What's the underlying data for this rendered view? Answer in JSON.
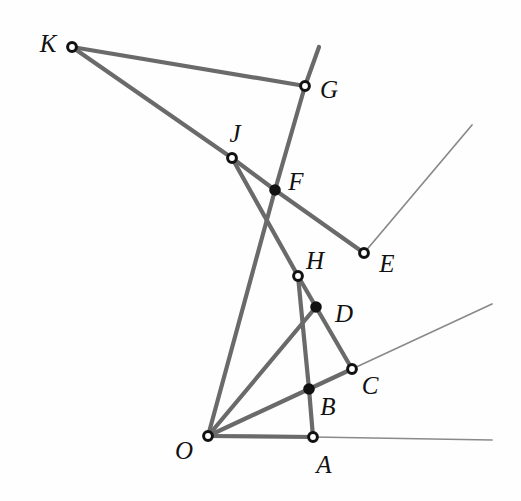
{
  "figure": {
    "kind": "geometry-diagram",
    "title": "",
    "background": "#fefefe",
    "stroke_thick": "#6a6a6a",
    "stroke_thin": "#8a8a8a",
    "dot_fill": "#111111",
    "dot_hollow_fill": "#ffffff",
    "dot_stroke": "#111111",
    "label_color": "#111111",
    "width": 521,
    "height": 501
  },
  "points": [
    {
      "id": "K",
      "label": "K",
      "x": 72,
      "y": 47,
      "marker": "hollow",
      "label_x": 48,
      "label_y": 43
    },
    {
      "id": "G",
      "label": "G",
      "x": 305,
      "y": 86,
      "marker": "hollow",
      "label_x": 329,
      "label_y": 89
    },
    {
      "id": "J",
      "label": "J",
      "x": 232,
      "y": 158,
      "marker": "hollow",
      "label_x": 235,
      "label_y": 133
    },
    {
      "id": "F",
      "label": "F",
      "x": 275,
      "y": 190,
      "marker": "filled",
      "label_x": 296,
      "label_y": 181
    },
    {
      "id": "E",
      "label": "E",
      "x": 364,
      "y": 253,
      "marker": "hollow",
      "label_x": 387,
      "label_y": 263
    },
    {
      "id": "H",
      "label": "H",
      "x": 298,
      "y": 276,
      "marker": "hollow",
      "label_x": 315,
      "label_y": 260
    },
    {
      "id": "D",
      "label": "D",
      "x": 316,
      "y": 307,
      "marker": "filled",
      "label_x": 344,
      "label_y": 313
    },
    {
      "id": "C",
      "label": "C",
      "x": 352,
      "y": 369,
      "marker": "hollow",
      "label_x": 370,
      "label_y": 385
    },
    {
      "id": "B",
      "label": "B",
      "x": 309,
      "y": 389,
      "marker": "filled",
      "label_x": 328,
      "label_y": 406
    },
    {
      "id": "O",
      "label": "O",
      "x": 208,
      "y": 436,
      "marker": "hollow",
      "label_x": 184,
      "label_y": 450
    },
    {
      "id": "A",
      "label": "A",
      "x": 313,
      "y": 437,
      "marker": "hollow",
      "label_x": 324,
      "label_y": 464
    }
  ],
  "segments": [
    {
      "name": "segment-K-G",
      "from": "K",
      "to": "G",
      "weight": "thick"
    },
    {
      "name": "segment-K-J",
      "from": "K",
      "to": "J",
      "weight": "thick"
    },
    {
      "name": "segment-J-F",
      "from": "J",
      "to": "F",
      "weight": "thick"
    },
    {
      "name": "segment-F-E",
      "from": "F",
      "to": "E",
      "weight": "thick"
    },
    {
      "name": "segment-G-F",
      "from": "G",
      "to": "F",
      "weight": "thick"
    },
    {
      "name": "segment-F-O",
      "from": "F",
      "to": "O",
      "weight": "thick"
    },
    {
      "name": "segment-J-H",
      "from": "J",
      "to": "H",
      "weight": "thick"
    },
    {
      "name": "segment-H-D",
      "from": "H",
      "to": "D",
      "weight": "thick"
    },
    {
      "name": "segment-D-C",
      "from": "D",
      "to": "C",
      "weight": "thick"
    },
    {
      "name": "segment-H-B",
      "from": "H",
      "to": "B",
      "weight": "thick"
    },
    {
      "name": "segment-B-A",
      "from": "B",
      "to": "A",
      "weight": "thick"
    },
    {
      "name": "segment-O-D",
      "from": "O",
      "to": "D",
      "weight": "thick"
    },
    {
      "name": "segment-O-C",
      "from": "O",
      "to": "C",
      "weight": "thick"
    },
    {
      "name": "segment-O-A",
      "from": "O",
      "to": "A",
      "weight": "thick"
    }
  ],
  "rays": [
    {
      "name": "ray-G-up",
      "from": "G",
      "x2": 319,
      "y2": 47,
      "weight": "thick"
    },
    {
      "name": "ray-O-E-ext",
      "from": "E",
      "x2": 472,
      "y2": 125,
      "weight": "thin"
    },
    {
      "name": "ray-O-C-ext",
      "from": "C",
      "x2": 492,
      "y2": 304,
      "weight": "thin"
    },
    {
      "name": "ray-O-A-ext",
      "from": "A",
      "x2": 492,
      "y2": 440,
      "weight": "thin"
    }
  ]
}
